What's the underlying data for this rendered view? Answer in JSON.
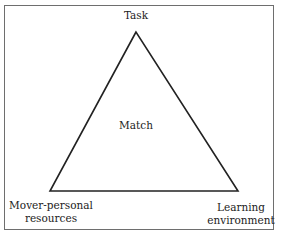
{
  "diagram": {
    "type": "triangle",
    "vertices": {
      "top": "Task",
      "bottom_left": "Mover-personal resources",
      "bottom_right": "Learning environment"
    },
    "center_label": "Match",
    "labels": {
      "task": "Task",
      "match": "Match",
      "mover_line1": "Mover-personal",
      "mover_line2": "resources",
      "learning_line1": "Learning",
      "learning_line2": "environment"
    },
    "colors": {
      "line": "#222222",
      "frame": "#6e6e6e",
      "background": "#ffffff"
    }
  }
}
